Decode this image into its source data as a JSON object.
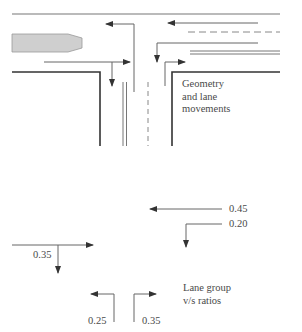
{
  "geometry_panel": {
    "caption": "Geometry\nand lane\nmovements"
  },
  "vs_panel": {
    "caption": "Lane group\nv/s ratios",
    "ratios": {
      "westbound_through": "0.45",
      "westbound_left": "0.20",
      "eastbound_through_right": "0.35",
      "northbound_left": "0.25",
      "northbound_through_right": "0.35"
    }
  },
  "colors": {
    "line": "#555555",
    "curb": "#333333",
    "island_fill": "#cfcfcf",
    "island_stroke": "#999999",
    "text": "#4a4a4a"
  }
}
